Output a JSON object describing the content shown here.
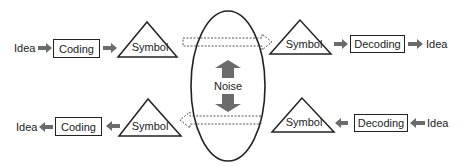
{
  "diagram": {
    "type": "communication-model",
    "colors": {
      "stroke": "#222222",
      "arrow_fill": "#6b6b6b",
      "dashed_stroke": "#555555",
      "background": "#ffffff"
    },
    "top_row": {
      "direction": "left-to-right",
      "source_label": "Idea",
      "encoder_label": "Coding",
      "sender_symbol_label": "Symbol",
      "receiver_symbol_label": "Symbol",
      "decoder_label": "Decoding",
      "destination_label": "Idea"
    },
    "bottom_row": {
      "direction": "right-to-left",
      "source_label": "Idea",
      "encoder_label": "Decoding",
      "sender_symbol_label": "Symbol",
      "receiver_symbol_label": "Symbol",
      "decoder_label": "Coding",
      "destination_label": "Idea"
    },
    "channel": {
      "shape": "ellipse",
      "noise_label": "Noise",
      "noise_arrows": [
        "up",
        "down"
      ]
    }
  }
}
